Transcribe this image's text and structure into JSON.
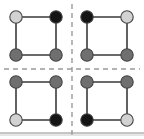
{
  "figure": {
    "title": "",
    "canvas": {
      "width": 144,
      "height": 139,
      "background": "#ffffff"
    },
    "palette": {
      "light": "#d2d2d2",
      "medium": "#6f6f6f",
      "black": "#141414",
      "node_outline": "#454545",
      "edge": "#3a3a3a",
      "divider": "#9a9a9a",
      "rule": "#8e8e8e"
    },
    "dividers": {
      "vertical": {
        "x": 72,
        "y1": 4,
        "y2": 135,
        "style": "dashed",
        "color": "#9a9a9a"
      },
      "horizontal": {
        "y": 69,
        "x1": 4,
        "x2": 140,
        "style": "dashed",
        "color": "#9a9a9a"
      }
    },
    "bottom_rule": {
      "y": 133,
      "x1": 0,
      "x2": 144,
      "color": "#8e8e8e"
    },
    "panels": [
      {
        "id": "panel-top-left",
        "label": "top-left",
        "square": {
          "x": 16,
          "y": 17,
          "width": 40,
          "height": 38
        },
        "nodes": [
          {
            "id": "tl-nw",
            "position": "top-left",
            "cx": 16,
            "cy": 17,
            "r": 6.2,
            "shade": "light",
            "color": "#d2d2d2"
          },
          {
            "id": "tl-ne",
            "position": "top-right",
            "cx": 56,
            "cy": 17,
            "r": 6.2,
            "shade": "black",
            "color": "#141414"
          },
          {
            "id": "tl-sw",
            "position": "bottom-left",
            "cx": 16,
            "cy": 55,
            "r": 6.2,
            "shade": "medium",
            "color": "#6f6f6f"
          },
          {
            "id": "tl-se",
            "position": "bottom-right",
            "cx": 56,
            "cy": 55,
            "r": 6.2,
            "shade": "medium",
            "color": "#6f6f6f"
          }
        ],
        "edges": [
          {
            "from": "tl-nw",
            "to": "tl-ne"
          },
          {
            "from": "tl-ne",
            "to": "tl-se"
          },
          {
            "from": "tl-se",
            "to": "tl-sw"
          },
          {
            "from": "tl-sw",
            "to": "tl-nw"
          }
        ]
      },
      {
        "id": "panel-top-right",
        "label": "top-right",
        "square": {
          "x": 87,
          "y": 17,
          "width": 40,
          "height": 38
        },
        "nodes": [
          {
            "id": "tr-nw",
            "position": "top-left",
            "cx": 87,
            "cy": 17,
            "r": 6.2,
            "shade": "black",
            "color": "#141414"
          },
          {
            "id": "tr-ne",
            "position": "top-right",
            "cx": 127,
            "cy": 17,
            "r": 6.2,
            "shade": "light",
            "color": "#d2d2d2"
          },
          {
            "id": "tr-sw",
            "position": "bottom-left",
            "cx": 87,
            "cy": 55,
            "r": 6.2,
            "shade": "medium",
            "color": "#6f6f6f"
          },
          {
            "id": "tr-se",
            "position": "bottom-right",
            "cx": 127,
            "cy": 55,
            "r": 6.2,
            "shade": "medium",
            "color": "#6f6f6f"
          }
        ],
        "edges": [
          {
            "from": "tr-nw",
            "to": "tr-ne"
          },
          {
            "from": "tr-ne",
            "to": "tr-se"
          },
          {
            "from": "tr-se",
            "to": "tr-sw"
          },
          {
            "from": "tr-sw",
            "to": "tr-nw"
          }
        ]
      },
      {
        "id": "panel-bottom-left",
        "label": "bottom-left",
        "square": {
          "x": 16,
          "y": 82,
          "width": 40,
          "height": 38
        },
        "nodes": [
          {
            "id": "bl-nw",
            "position": "top-left",
            "cx": 16,
            "cy": 82,
            "r": 6.2,
            "shade": "medium",
            "color": "#6f6f6f"
          },
          {
            "id": "bl-ne",
            "position": "top-right",
            "cx": 56,
            "cy": 82,
            "r": 6.2,
            "shade": "medium",
            "color": "#6f6f6f"
          },
          {
            "id": "bl-sw",
            "position": "bottom-left",
            "cx": 16,
            "cy": 120,
            "r": 6.2,
            "shade": "light",
            "color": "#d2d2d2"
          },
          {
            "id": "bl-se",
            "position": "bottom-right",
            "cx": 56,
            "cy": 120,
            "r": 6.2,
            "shade": "black",
            "color": "#141414"
          }
        ],
        "edges": [
          {
            "from": "bl-nw",
            "to": "bl-ne"
          },
          {
            "from": "bl-ne",
            "to": "bl-se"
          },
          {
            "from": "bl-se",
            "to": "bl-sw"
          },
          {
            "from": "bl-sw",
            "to": "bl-nw"
          }
        ]
      },
      {
        "id": "panel-bottom-right",
        "label": "bottom-right",
        "square": {
          "x": 87,
          "y": 82,
          "width": 40,
          "height": 38
        },
        "nodes": [
          {
            "id": "br-nw",
            "position": "top-left",
            "cx": 87,
            "cy": 82,
            "r": 6.2,
            "shade": "medium",
            "color": "#6f6f6f"
          },
          {
            "id": "br-ne",
            "position": "top-right",
            "cx": 127,
            "cy": 82,
            "r": 6.2,
            "shade": "medium",
            "color": "#6f6f6f"
          },
          {
            "id": "br-sw",
            "position": "bottom-left",
            "cx": 87,
            "cy": 120,
            "r": 6.2,
            "shade": "black",
            "color": "#141414"
          },
          {
            "id": "br-se",
            "position": "bottom-right",
            "cx": 127,
            "cy": 120,
            "r": 6.2,
            "shade": "light",
            "color": "#d2d2d2"
          }
        ],
        "edges": [
          {
            "from": "br-nw",
            "to": "br-ne"
          },
          {
            "from": "br-ne",
            "to": "br-se"
          },
          {
            "from": "br-se",
            "to": "br-sw"
          },
          {
            "from": "br-sw",
            "to": "br-nw"
          }
        ]
      }
    ]
  }
}
